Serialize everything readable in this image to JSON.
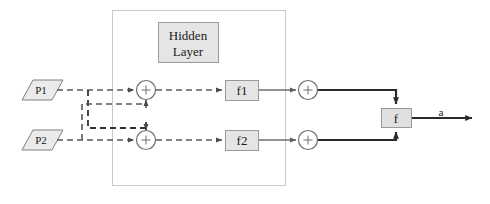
{
  "diagram": {
    "background_color": "#ffffff",
    "container": {
      "label": "hidden-layer-region",
      "border_color": "#c8c8c8"
    },
    "hidden_layer_box": {
      "line1": "Hidden",
      "line2": "Layer",
      "fill": "#e5e5e5",
      "border_color": "#9a9a9a"
    },
    "inputs": [
      {
        "label": "P1",
        "fill": "#ebebeb",
        "border_color": "#808080"
      },
      {
        "label": "P2",
        "fill": "#ebebeb",
        "border_color": "#808080"
      }
    ],
    "sum_nodes": [
      {
        "label": "+",
        "name": "sum-node-hidden-1"
      },
      {
        "label": "+",
        "name": "sum-node-hidden-2"
      },
      {
        "label": "+",
        "name": "sum-node-output-1"
      },
      {
        "label": "+",
        "name": "sum-node-output-2"
      }
    ],
    "activation_boxes": [
      {
        "label": "f1",
        "fill": "#e5e5e5",
        "border_color": "#9a9a9a"
      },
      {
        "label": "f2",
        "fill": "#e5e5e5",
        "border_color": "#9a9a9a"
      }
    ],
    "output_box": {
      "label": "f",
      "fill": "#e0e0e0",
      "border_color": "#9a9a9a"
    },
    "output_signal": {
      "label": "a"
    },
    "edge_styles": {
      "dashed_color": "#595959",
      "solid_color": "#6e6e6e",
      "thick_color": "#2b2b2b"
    }
  }
}
